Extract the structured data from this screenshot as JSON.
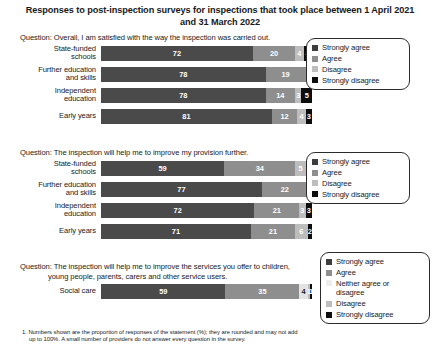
{
  "title": "Responses to post-inspection surveys for inspections that took place between 1 April 2021 and 31 March 2022",
  "footnote": {
    "line1": "1. Numbers shown are the proportion of responses of the statement (%); they are rounded and may not add",
    "line2": "up to 100%. A small number of providers do not answer every question in the survey."
  },
  "sections": [
    {
      "question": "Question: Overall, I am satisfied with the way the inspection was carried out.",
      "question_line2": "",
      "legend": [
        {
          "label": "Strongly agree",
          "color": "#3d3d3d",
          "key": "sa"
        },
        {
          "label": "Agree",
          "color": "#8e8e8e",
          "key": "ag"
        },
        {
          "label": "Disagree",
          "color": "#bdbdbd",
          "key": "dg"
        },
        {
          "label": "Strongly disagree",
          "color": "#0d0d0d",
          "key": "sd"
        }
      ],
      "rows": [
        {
          "label_line1": "State-funded",
          "label_line2": "schools",
          "values": [
            72,
            20,
            4,
            4
          ]
        },
        {
          "label_line1": "Further education",
          "label_line2": "and skills",
          "values": [
            78,
            19,
            2,
            1
          ]
        },
        {
          "label_line1": "Independent",
          "label_line2": "education",
          "values": [
            78,
            14,
            3,
            5
          ]
        },
        {
          "label_line1": "Early years",
          "label_line2": "",
          "values": [
            81,
            12,
            4,
            3
          ]
        }
      ]
    },
    {
      "question": "Question: The inspection will help me to improve my provision further.",
      "question_line2": "",
      "legend": [
        {
          "label": "Strongly agree",
          "color": "#3d3d3d",
          "key": "sa"
        },
        {
          "label": "Agree",
          "color": "#8e8e8e",
          "key": "ag"
        },
        {
          "label": "Disagree",
          "color": "#bdbdbd",
          "key": "dg"
        },
        {
          "label": "Strongly disagree",
          "color": "#0d0d0d",
          "key": "sd"
        }
      ],
      "rows": [
        {
          "label_line1": "State-funded",
          "label_line2": "schools",
          "values": [
            59,
            34,
            5,
            3
          ]
        },
        {
          "label_line1": "Further education",
          "label_line2": "and skills",
          "values": [
            77,
            22,
            1,
            1
          ]
        },
        {
          "label_line1": "Independent",
          "label_line2": "education",
          "values": [
            72,
            21,
            3,
            3
          ]
        },
        {
          "label_line1": "Early years",
          "label_line2": "",
          "values": [
            71,
            21,
            6,
            2
          ]
        }
      ]
    },
    {
      "question": "Question: The inspection will help me to improve the services you offer to children,",
      "question_line2": "young people, parents, carers and other service users.",
      "legend": [
        {
          "label": "Strongly agree",
          "color": "#3d3d3d",
          "key": "sa"
        },
        {
          "label": "Agree",
          "color": "#8e8e8e",
          "key": "ag"
        },
        {
          "label": "Neither agree or\ndisagree",
          "color": "#ededed",
          "key": "nt"
        },
        {
          "label": "Disagree",
          "color": "#bdbdbd",
          "key": "dg"
        },
        {
          "label": "Strongly disagree",
          "color": "#0d0d0d",
          "key": "sd"
        }
      ],
      "rows": [
        {
          "label_line1": "Social care",
          "label_line2": "",
          "values": [
            59,
            35,
            4,
            1,
            1
          ]
        }
      ]
    }
  ],
  "chart_data": {
    "type": "bar",
    "title": "Responses to post-inspection surveys for inspections that took place between 1 April 2021 and 31 March 2022",
    "xlabel": "",
    "ylabel": "",
    "xlim": [
      0,
      100
    ],
    "orientation": "horizontal",
    "stacked": true,
    "stacked_percent": true,
    "grid": false,
    "legend_position": "right",
    "panels": [
      {
        "question": "Question: Overall, I am satisfied with the way the inspection was carried out.",
        "categories": [
          "State-funded schools",
          "Further education and skills",
          "Independent education",
          "Early years"
        ],
        "series": [
          {
            "name": "Strongly agree",
            "values": [
              72,
              78,
              78,
              81
            ]
          },
          {
            "name": "Agree",
            "values": [
              20,
              19,
              14,
              12
            ]
          },
          {
            "name": "Disagree",
            "values": [
              4,
              2,
              3,
              4
            ]
          },
          {
            "name": "Strongly disagree",
            "values": [
              4,
              1,
              5,
              3
            ]
          }
        ]
      },
      {
        "question": "Question: The inspection will help me to improve my provision further.",
        "categories": [
          "State-funded schools",
          "Further education and skills",
          "Independent education",
          "Early years"
        ],
        "series": [
          {
            "name": "Strongly agree",
            "values": [
              59,
              77,
              72,
              71
            ]
          },
          {
            "name": "Agree",
            "values": [
              34,
              22,
              21,
              21
            ]
          },
          {
            "name": "Disagree",
            "values": [
              5,
              1,
              3,
              6
            ]
          },
          {
            "name": "Strongly disagree",
            "values": [
              3,
              1,
              3,
              2
            ]
          }
        ]
      },
      {
        "question": "Question: The inspection will help me to improve the services you offer to children, young people, parents, carers and other service users.",
        "categories": [
          "Social care"
        ],
        "series": [
          {
            "name": "Strongly agree",
            "values": [
              59
            ]
          },
          {
            "name": "Agree",
            "values": [
              35
            ]
          },
          {
            "name": "Neither agree or disagree",
            "values": [
              4
            ]
          },
          {
            "name": "Disagree",
            "values": [
              1
            ]
          },
          {
            "name": "Strongly disagree",
            "values": [
              1
            ]
          }
        ]
      }
    ],
    "annotations": [
      "1. Numbers shown are the proportion of responses of the statement (%); they are rounded and may not add up to 100%. A small number of providers do not answer every question in the survey."
    ]
  }
}
